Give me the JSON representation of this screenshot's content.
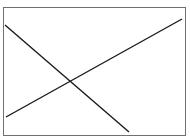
{
  "diagram": {
    "frame": {
      "x": 3,
      "y": 7,
      "width": 182,
      "height": 128,
      "stroke": "#707070",
      "fill": "#ffffff"
    },
    "lines": [
      {
        "id": "descending-line",
        "x1": 5,
        "y1": 25,
        "x2": 129,
        "y2": 132,
        "stroke": "#1a1a1a"
      },
      {
        "id": "ascending-line",
        "x1": 6,
        "y1": 117,
        "x2": 182,
        "y2": 19,
        "stroke": "#1a1a1a"
      }
    ],
    "intersection": {
      "x": 69,
      "y": 81
    }
  }
}
